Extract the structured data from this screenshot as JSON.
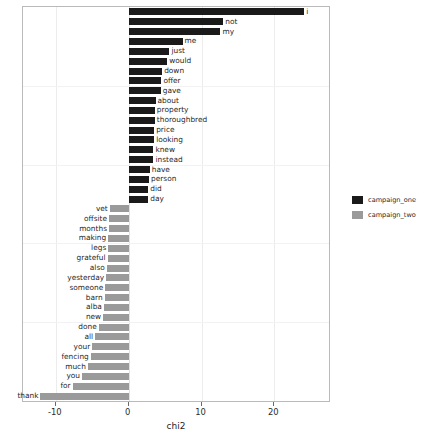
{
  "chart_data": {
    "type": "bar",
    "orientation": "horizontal",
    "title": "",
    "xlabel": "chi2",
    "ylabel": "",
    "xlim": [
      -14.5,
      27.5
    ],
    "xticks": [
      -10,
      0,
      10,
      20
    ],
    "xtick_labels": [
      "-10",
      "0",
      "10",
      "20"
    ],
    "grid": true,
    "legend_position": "right",
    "series": [
      {
        "name": "campaign_one",
        "color": "#1a1a1a"
      },
      {
        "name": "campaign_two",
        "color": "#9a9a9a"
      }
    ],
    "bars": [
      {
        "label": "i",
        "value": 24.1,
        "series": "campaign_one"
      },
      {
        "label": "not",
        "value": 13.0,
        "series": "campaign_one"
      },
      {
        "label": "my",
        "value": 12.6,
        "series": "campaign_one"
      },
      {
        "label": "me",
        "value": 7.4,
        "series": "campaign_one"
      },
      {
        "label": "just",
        "value": 5.6,
        "series": "campaign_one"
      },
      {
        "label": "would",
        "value": 5.3,
        "series": "campaign_one"
      },
      {
        "label": "down",
        "value": 4.6,
        "series": "campaign_one"
      },
      {
        "label": "offer",
        "value": 4.5,
        "series": "campaign_one"
      },
      {
        "label": "gave",
        "value": 4.4,
        "series": "campaign_one"
      },
      {
        "label": "about",
        "value": 3.7,
        "series": "campaign_one"
      },
      {
        "label": "property",
        "value": 3.6,
        "series": "campaign_one"
      },
      {
        "label": "thoroughbred",
        "value": 3.6,
        "series": "campaign_one"
      },
      {
        "label": "price",
        "value": 3.5,
        "series": "campaign_one"
      },
      {
        "label": "looking",
        "value": 3.5,
        "series": "campaign_one"
      },
      {
        "label": "knew",
        "value": 3.4,
        "series": "campaign_one"
      },
      {
        "label": "instead",
        "value": 3.4,
        "series": "campaign_one"
      },
      {
        "label": "have",
        "value": 2.9,
        "series": "campaign_one"
      },
      {
        "label": "person",
        "value": 2.8,
        "series": "campaign_one"
      },
      {
        "label": "did",
        "value": 2.7,
        "series": "campaign_one"
      },
      {
        "label": "day",
        "value": 2.7,
        "series": "campaign_one"
      },
      {
        "label": "vet",
        "value": -2.6,
        "series": "campaign_two"
      },
      {
        "label": "offsite",
        "value": -2.7,
        "series": "campaign_two"
      },
      {
        "label": "months",
        "value": -2.7,
        "series": "campaign_two"
      },
      {
        "label": "making",
        "value": -2.8,
        "series": "campaign_two"
      },
      {
        "label": "legs",
        "value": -2.8,
        "series": "campaign_two"
      },
      {
        "label": "grateful",
        "value": -2.9,
        "series": "campaign_two"
      },
      {
        "label": "also",
        "value": -3.0,
        "series": "campaign_two"
      },
      {
        "label": "yesterday",
        "value": -3.1,
        "series": "campaign_two"
      },
      {
        "label": "someone",
        "value": -3.2,
        "series": "campaign_two"
      },
      {
        "label": "barn",
        "value": -3.3,
        "series": "campaign_two"
      },
      {
        "label": "alba",
        "value": -3.4,
        "series": "campaign_two"
      },
      {
        "label": "new",
        "value": -3.5,
        "series": "campaign_two"
      },
      {
        "label": "done",
        "value": -4.1,
        "series": "campaign_two"
      },
      {
        "label": "all",
        "value": -4.6,
        "series": "campaign_two"
      },
      {
        "label": "your",
        "value": -5.0,
        "series": "campaign_two"
      },
      {
        "label": "fencing",
        "value": -5.2,
        "series": "campaign_two"
      },
      {
        "label": "much",
        "value": -5.6,
        "series": "campaign_two"
      },
      {
        "label": "you",
        "value": -6.4,
        "series": "campaign_two"
      },
      {
        "label": "for",
        "value": -7.7,
        "series": "campaign_two"
      },
      {
        "label": "thank",
        "value": -12.1,
        "series": "campaign_two"
      }
    ]
  },
  "legend": {
    "items": [
      {
        "label": "campaign_one"
      },
      {
        "label": "campaign_two"
      }
    ]
  },
  "axis": {
    "x_title": "chi2"
  }
}
